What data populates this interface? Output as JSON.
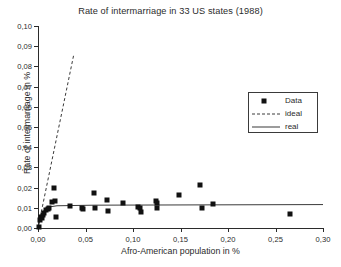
{
  "chart_data": {
    "type": "scatter",
    "title": "Rate of intermarriage in 33 US states (1988)",
    "xlabel": "Afro-American population in %",
    "ylabel": "Rate of intermarriage in %",
    "xlim": [
      0.0,
      0.3
    ],
    "ylim": [
      0.0,
      0.1
    ],
    "xticks": [
      "0,00",
      "0,05",
      "0,10",
      "0,15",
      "0,20",
      "0,25",
      "0,30"
    ],
    "xtick_values": [
      0.0,
      0.05,
      0.1,
      0.15,
      0.2,
      0.25,
      0.3
    ],
    "yticks": [
      "0,00",
      "0,01",
      "0,02",
      "0,03",
      "0,04",
      "0,05",
      "0,06",
      "0,07",
      "0,08",
      "0,09",
      "0,10"
    ],
    "ytick_values": [
      0.0,
      0.01,
      0.02,
      0.03,
      0.04,
      0.05,
      0.06,
      0.07,
      0.08,
      0.09,
      0.1
    ],
    "grid": false,
    "legend_position": "upper-right",
    "decimal_separator": ",",
    "series": [
      {
        "name": "Data",
        "type": "scatter",
        "marker": "filled-square",
        "color": "#111111",
        "points": [
          [
            0.001,
            0.0005
          ],
          [
            0.002,
            0.004
          ],
          [
            0.003,
            0.0055
          ],
          [
            0.004,
            0.0048
          ],
          [
            0.005,
            0.0062
          ],
          [
            0.006,
            0.0072
          ],
          [
            0.008,
            0.0088
          ],
          [
            0.01,
            0.0095
          ],
          [
            0.012,
            0.0098
          ],
          [
            0.015,
            0.0128
          ],
          [
            0.017,
            0.02
          ],
          [
            0.018,
            0.0135
          ],
          [
            0.019,
            0.0055
          ],
          [
            0.034,
            0.0108
          ],
          [
            0.046,
            0.0098
          ],
          [
            0.047,
            0.0092
          ],
          [
            0.059,
            0.0175
          ],
          [
            0.06,
            0.0101
          ],
          [
            0.073,
            0.0141
          ],
          [
            0.074,
            0.0086
          ],
          [
            0.089,
            0.0124
          ],
          [
            0.105,
            0.0104
          ],
          [
            0.107,
            0.0098
          ],
          [
            0.108,
            0.0078
          ],
          [
            0.124,
            0.0132
          ],
          [
            0.125,
            0.0126
          ],
          [
            0.125,
            0.0098
          ],
          [
            0.148,
            0.0164
          ],
          [
            0.171,
            0.0211
          ],
          [
            0.173,
            0.0101
          ],
          [
            0.184,
            0.0118
          ],
          [
            0.265,
            0.0068
          ]
        ]
      },
      {
        "name": "ideal",
        "type": "line",
        "style": "dashed",
        "color": "#3a3a3a",
        "points": [
          [
            0.0,
            0.0
          ],
          [
            0.0375,
            0.0855
          ]
        ]
      },
      {
        "name": "real",
        "type": "line",
        "style": "solid",
        "color": "#3a3a3a",
        "points": [
          [
            0.0,
            0.0
          ],
          [
            0.004,
            0.0075
          ],
          [
            0.01,
            0.0103
          ],
          [
            0.02,
            0.011
          ],
          [
            0.06,
            0.0113
          ],
          [
            0.3,
            0.0116
          ]
        ]
      }
    ],
    "legend_entries": [
      {
        "label": "Data",
        "symbol": "filled-square"
      },
      {
        "label": "ideal",
        "symbol": "dashed-line"
      },
      {
        "label": "real",
        "symbol": "solid-line"
      }
    ]
  }
}
